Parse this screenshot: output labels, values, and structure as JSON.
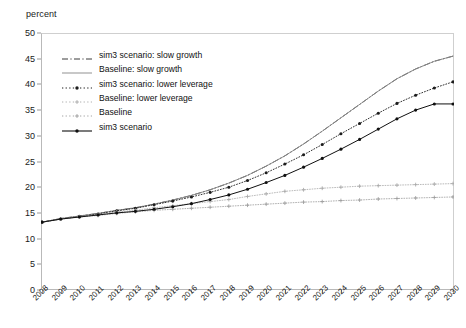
{
  "chart_data": {
    "type": "line",
    "title": "",
    "subtitle": "",
    "xlabel": "",
    "ylabel": "percent",
    "unit_label": "percent",
    "xlim": [
      2008,
      2030
    ],
    "ylim": [
      0,
      50
    ],
    "ytick_step": 5,
    "grid": false,
    "legend_position": "upper-left-inside",
    "x": [
      2008,
      2009,
      2010,
      2011,
      2012,
      2013,
      2014,
      2015,
      2016,
      2017,
      2018,
      2019,
      2020,
      2021,
      2022,
      2023,
      2024,
      2025,
      2026,
      2027,
      2028,
      2029,
      2030
    ],
    "categories": [
      "2008",
      "2009",
      "2010",
      "2011",
      "2012",
      "2013",
      "2014",
      "2015",
      "2016",
      "2017",
      "2018",
      "2019",
      "2020",
      "2021",
      "2022",
      "2023",
      "2024",
      "2025",
      "2026",
      "2027",
      "2028",
      "2029",
      "2030"
    ],
    "yticks": [
      0,
      5,
      10,
      15,
      20,
      25,
      30,
      35,
      40,
      45,
      50
    ],
    "series": [
      {
        "name": "sim3 scenario: slow growth",
        "style": "dash-dot",
        "color": "#3a3a3a",
        "marker": "none",
        "width": 0.9,
        "values": [
          13.2,
          13.9,
          14.4,
          14.9,
          15.5,
          16.0,
          16.7,
          17.5,
          18.4,
          19.5,
          20.8,
          22.3,
          24.1,
          26.1,
          28.4,
          30.9,
          33.5,
          36.1,
          38.7,
          41.1,
          43.0,
          44.5,
          45.5
        ]
      },
      {
        "name": "Baseline: slow growth",
        "style": "solid",
        "color": "#8a8a8a",
        "marker": "none",
        "width": 0.9,
        "values": [
          13.2,
          13.9,
          14.4,
          14.9,
          15.5,
          16.0,
          16.7,
          17.5,
          18.4,
          19.5,
          20.8,
          22.3,
          24.1,
          26.1,
          28.4,
          30.9,
          33.5,
          36.1,
          38.7,
          41.1,
          43.0,
          44.5,
          45.5
        ]
      },
      {
        "name": "sim3 scenario: lower leverage",
        "style": "dotted",
        "color": "#1c1c1c",
        "marker": "dot",
        "width": 0.9,
        "values": [
          13.2,
          13.8,
          14.3,
          14.8,
          15.4,
          15.9,
          16.6,
          17.3,
          18.1,
          19.0,
          20.0,
          21.3,
          22.8,
          24.5,
          26.3,
          28.3,
          30.4,
          32.4,
          34.4,
          36.3,
          37.9,
          39.3,
          40.5
        ]
      },
      {
        "name": "Baseline: lower leverage",
        "style": "dotted",
        "color": "#a8a8a8",
        "marker": "plus",
        "width": 0.8,
        "values": [
          13.2,
          13.8,
          14.3,
          14.7,
          15.2,
          15.5,
          16.0,
          16.4,
          16.8,
          17.2,
          17.6,
          18.2,
          18.7,
          19.2,
          19.5,
          19.8,
          20.0,
          20.2,
          20.3,
          20.4,
          20.5,
          20.6,
          20.7
        ]
      },
      {
        "name": "Baseline",
        "style": "dotted",
        "color": "#9c9c9c",
        "marker": "plus",
        "width": 0.8,
        "values": [
          13.2,
          13.8,
          14.2,
          14.5,
          14.9,
          15.2,
          15.5,
          15.7,
          15.9,
          16.1,
          16.3,
          16.5,
          16.7,
          16.9,
          17.1,
          17.2,
          17.4,
          17.5,
          17.7,
          17.8,
          17.9,
          18.0,
          18.1
        ]
      },
      {
        "name": "sim3 scenario",
        "style": "solid",
        "color": "#101010",
        "marker": "dot",
        "width": 1.0,
        "values": [
          13.2,
          13.8,
          14.2,
          14.6,
          15.0,
          15.3,
          15.7,
          16.2,
          16.8,
          17.6,
          18.5,
          19.6,
          20.9,
          22.3,
          23.9,
          25.6,
          27.4,
          29.3,
          31.3,
          33.3,
          35.0,
          36.2,
          36.2
        ]
      }
    ],
    "legend": [
      {
        "label": "sim3 scenario: slow growth",
        "key": "dash-dot",
        "color": "#3a3a3a",
        "marker": "none"
      },
      {
        "label": "Baseline: slow growth",
        "key": "solid",
        "color": "#9b9b9b",
        "marker": "none"
      },
      {
        "label": "sim3 scenario: lower leverage",
        "key": "dotted",
        "color": "#1c1c1c",
        "marker": "dot"
      },
      {
        "label": "Baseline: lower leverage",
        "key": "dotted",
        "color": "#b0b0b0",
        "marker": "plus"
      },
      {
        "label": "Baseline",
        "key": "dotted",
        "color": "#a4a4a4",
        "marker": "plus"
      },
      {
        "label": "sim3 scenario",
        "key": "solid",
        "color": "#101010",
        "marker": "dot"
      }
    ]
  }
}
